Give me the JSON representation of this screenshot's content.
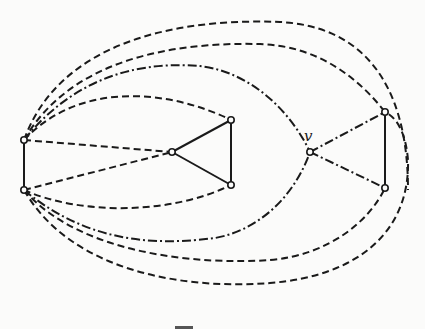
{
  "diagram": {
    "type": "graph",
    "nodes": [
      {
        "id": "a",
        "label": ""
      },
      {
        "id": "b",
        "label": ""
      },
      {
        "id": "c",
        "label": ""
      },
      {
        "id": "d",
        "label": ""
      },
      {
        "id": "e",
        "label": ""
      },
      {
        "id": "v",
        "label": "v"
      },
      {
        "id": "f",
        "label": ""
      },
      {
        "id": "g",
        "label": ""
      }
    ],
    "edges": [
      {
        "from": "a",
        "to": "b",
        "style": "solid"
      },
      {
        "from": "c",
        "to": "d",
        "style": "solid"
      },
      {
        "from": "c",
        "to": "e",
        "style": "solid"
      },
      {
        "from": "d",
        "to": "e",
        "style": "solid"
      },
      {
        "from": "f",
        "to": "g",
        "style": "solid"
      },
      {
        "from": "a",
        "to": "c",
        "style": "dashed"
      },
      {
        "from": "b",
        "to": "c",
        "style": "dashed"
      },
      {
        "from": "a",
        "to": "d",
        "style": "dashed"
      },
      {
        "from": "b",
        "to": "e",
        "style": "dashed"
      },
      {
        "from": "a",
        "to": "v",
        "style": "dash-dot"
      },
      {
        "from": "b",
        "to": "v",
        "style": "dash-dot"
      },
      {
        "from": "v",
        "to": "f",
        "style": "dash-dot"
      },
      {
        "from": "v",
        "to": "g",
        "style": "dash-dot"
      },
      {
        "from": "a",
        "to": "f",
        "style": "dashed"
      },
      {
        "from": "a",
        "to": "g",
        "style": "dashed"
      },
      {
        "from": "b",
        "to": "f",
        "style": "dashed"
      },
      {
        "from": "b",
        "to": "g",
        "style": "dashed"
      }
    ]
  }
}
